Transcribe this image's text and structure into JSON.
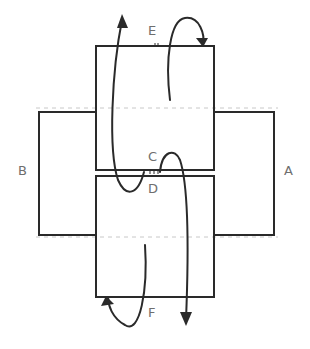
{
  "diagram": {
    "title": "",
    "labels": {
      "A": "A",
      "B": "B",
      "C": "C",
      "D": "D",
      "E": "E",
      "F": "F"
    },
    "panels": [
      {
        "id": "top-panel",
        "between": [
          "E",
          "C"
        ]
      },
      {
        "id": "bottom-panel",
        "between": [
          "D",
          "F"
        ]
      },
      {
        "id": "left-panel",
        "label": "B"
      },
      {
        "id": "right-panel",
        "label": "A"
      }
    ],
    "colors": {
      "stroke": "#2a2a2a",
      "dashed": "#c8c8c8",
      "label": "#6e6e6e",
      "background": "#ffffff"
    }
  }
}
